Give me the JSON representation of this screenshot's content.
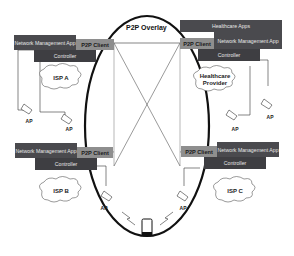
{
  "overlay": {
    "title": "P2P Overlay"
  },
  "nodes": {
    "top_left": {
      "app_label": "Network Management App",
      "client_label": "P2P Client",
      "controller_label": "Controller",
      "cloud_label": "ISP A",
      "ap_labels": [
        "AP",
        "AP"
      ]
    },
    "top_right": {
      "extra_app_label": "Healthcare Apps",
      "app_label": "Network Management App",
      "client_label": "P2P Client",
      "controller_label": "Controller",
      "cloud_label": "Healthcare Provider",
      "ap_labels": [
        "AP",
        "AP"
      ]
    },
    "bottom_left": {
      "app_label": "Network Management App",
      "client_label": "P2P Client",
      "controller_label": "Controller",
      "cloud_label": "ISP B",
      "ap_labels": [
        "AP"
      ]
    },
    "bottom_right": {
      "app_label": "Network Management App",
      "client_label": "P2P Client",
      "controller_label": "Controller",
      "cloud_label": "ISP C",
      "ap_labels": [
        "AP"
      ]
    }
  },
  "device": {
    "name": "mobile-phone"
  },
  "colors": {
    "app_box": "#4a4a4e",
    "client_box": "#8e8e8e",
    "line": "#222222"
  }
}
